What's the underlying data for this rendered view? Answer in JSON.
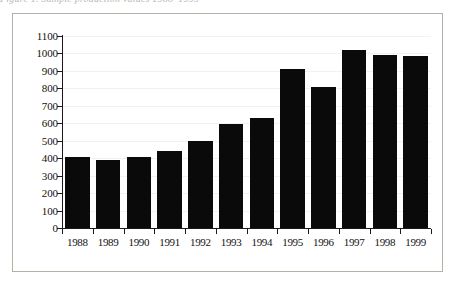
{
  "figure": {
    "top_caption": "Figure 1.  Sample production values 1988–1999",
    "frame_color": "#b5b0a6",
    "bar_color": "#0a0a0a",
    "axis_color": "#1a1a1a",
    "gridline_color": "#f2f2f2",
    "background_color": "#ffffff"
  },
  "chart_data": {
    "type": "bar",
    "title": "",
    "subtitle": "",
    "xlabel": "",
    "ylabel": "",
    "categories": [
      "1988",
      "1989",
      "1990",
      "1991",
      "1992",
      "1993",
      "1994",
      "1995",
      "1996",
      "1997",
      "1998",
      "1999"
    ],
    "values": [
      405,
      390,
      405,
      440,
      500,
      595,
      630,
      910,
      810,
      1020,
      990,
      985
    ],
    "ylim": [
      0,
      1100
    ],
    "ytick_values": [
      0,
      100,
      200,
      300,
      400,
      500,
      600,
      700,
      800,
      900,
      1000,
      1100
    ],
    "ytick_labels": [
      "0",
      "100",
      "200",
      "300",
      "400",
      "500",
      "600",
      "700",
      "800",
      "900",
      "1000",
      "1100"
    ],
    "grid": true,
    "grid_axis": "y",
    "legend": false,
    "legend_position": "none",
    "bar_orientation": "vertical",
    "series": [
      {
        "name": "",
        "values": [
          405,
          390,
          405,
          440,
          500,
          595,
          630,
          910,
          810,
          1020,
          990,
          985
        ]
      }
    ]
  }
}
